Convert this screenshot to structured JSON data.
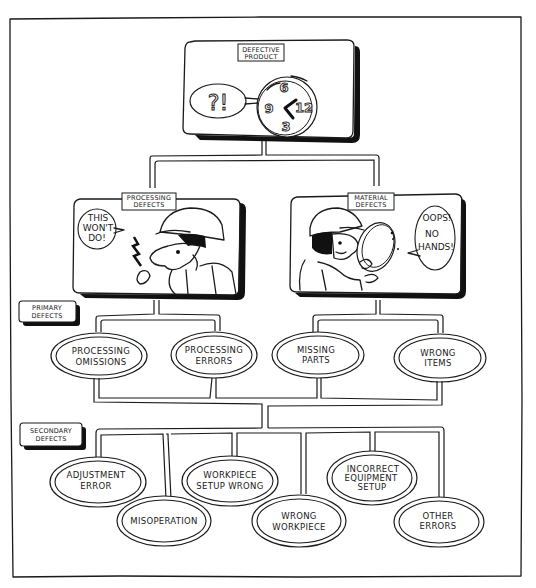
{
  "diagram": {
    "type": "defect-classification-tree",
    "root": {
      "label_line1": "DEFECTIVE",
      "label_line2": "PRODUCT",
      "speech": "?!",
      "clock_numbers": [
        "6",
        "9",
        "12",
        "3"
      ]
    },
    "categories": [
      {
        "label_line1": "PROCESSING",
        "label_line2": "DEFECTS",
        "speech_line1": "THIS",
        "speech_line2": "WON'T",
        "speech_line3": "DO!"
      },
      {
        "label_line1": "MATERIAL",
        "label_line2": "DEFECTS",
        "speech_line1": "OOPS!",
        "speech_line2": "NO",
        "speech_line3": "HANDS!"
      }
    ],
    "levels": {
      "primary_line1": "PRIMARY",
      "primary_line2": "DEFECTS",
      "secondary_line1": "SECONDARY",
      "secondary_line2": "DEFECTS"
    },
    "primary_defects": [
      {
        "line1": "PROCESSING",
        "line2": "OMISSIONS",
        "parent": "PROCESSING DEFECTS"
      },
      {
        "line1": "PROCESSING",
        "line2": "ERRORS",
        "parent": "PROCESSING DEFECTS"
      },
      {
        "line1": "MISSING",
        "line2": "PARTS",
        "parent": "MATERIAL DEFECTS"
      },
      {
        "line1": "WRONG",
        "line2": "ITEMS",
        "parent": "MATERIAL DEFECTS"
      }
    ],
    "secondary_defects": [
      {
        "line1": "ADJUSTMENT",
        "line2": "ERROR",
        "line3": ""
      },
      {
        "line1": "MISOPERATION",
        "line2": "",
        "line3": ""
      },
      {
        "line1": "WORKPIECE",
        "line2": "SETUP WRONG",
        "line3": ""
      },
      {
        "line1": "WRONG",
        "line2": "WORKPIECE",
        "line3": ""
      },
      {
        "line1": "INCORRECT",
        "line2": "EQUIPMENT",
        "line3": "SETUP"
      },
      {
        "line1": "OTHER",
        "line2": "ERRORS",
        "line3": ""
      }
    ]
  }
}
